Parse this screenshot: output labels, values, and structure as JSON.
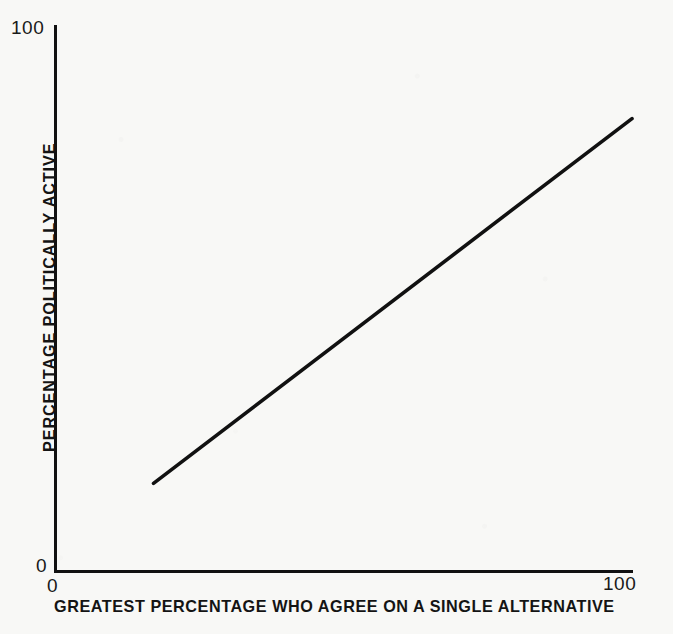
{
  "chart_data": {
    "type": "line",
    "title": "",
    "subtitle": "",
    "xlabel": "GREATEST PERCENTAGE WHO AGREE ON A SINGLE ALTERNATIVE",
    "ylabel": "PERCENTAGE POLITICALLY ACTIVE",
    "xlim": [
      0,
      100
    ],
    "ylim": [
      0,
      100
    ],
    "xticks": [
      "0",
      "100"
    ],
    "yticks": [
      "0",
      "100"
    ],
    "grid": false,
    "legend": null,
    "annotations": [],
    "series": [
      {
        "name": "political activity vs. agreement",
        "x": [
          17,
          100
        ],
        "y": [
          16,
          83
        ],
        "style": "solid straight line, no markers",
        "color": "#111111"
      }
    ]
  },
  "axes": {
    "y_tick_max": "100",
    "y_tick_min": "0",
    "x_tick_min": "0",
    "x_tick_max": "100",
    "x_title": "GREATEST PERCENTAGE WHO AGREE ON A SINGLE ALTERNATIVE",
    "y_title": "PERCENTAGE POLITICALLY ACTIVE"
  },
  "colors": {
    "ink": "#111111",
    "paper": "#f8f8f6",
    "line": "#111111"
  }
}
